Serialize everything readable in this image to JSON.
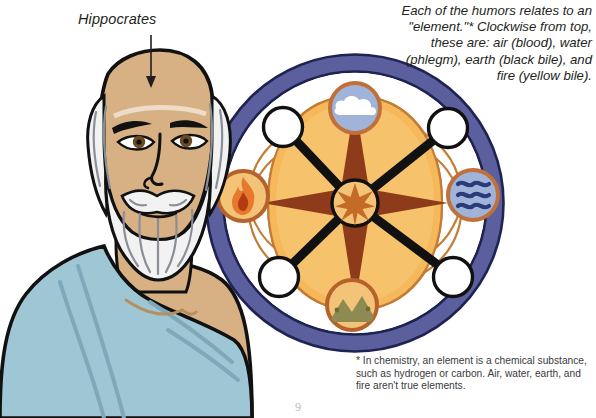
{
  "page": {
    "background_color": "#ffffff",
    "width": 596,
    "height": 418,
    "page_number": "9"
  },
  "annotations": {
    "figure_label": "Hippocrates",
    "caption": "Each of the humors relates to an \"element.\"* Clockwise from top, these are: air (blood), water (phlegm), earth (black bile), and fire (yellow bile).",
    "footnote": "* In chemistry, an element is a chemical substance, such as hydrogen or carbon. Air, water, earth, and fire aren't true elements."
  },
  "figure": {
    "name": "Hippocrates",
    "colors": {
      "skin": "#d7b183",
      "skin_shadow": "#c49a6c",
      "hair": "#f2f2f2",
      "hair_line": "#8a8f96",
      "robe": "#9ec6d4",
      "robe_shadow": "#7fa9ba",
      "outline": "#111111",
      "eye": "#6b4a22"
    }
  },
  "wheel": {
    "name": "humors-element-wheel",
    "center": {
      "x": 355,
      "y": 203
    },
    "outer_radius": 145,
    "colors": {
      "outer_ring": "#5b5f9e",
      "outer_ring_outline": "#1f2352",
      "inner_field": "#f5b95c",
      "inner_field_light": "#f8cd84",
      "star_dark": "#8e3b1c",
      "lens_white": "#ffffff",
      "lens_outline": "#c47b34",
      "node_white": "#ffffff",
      "node_outline": "#111111",
      "spoke": "#111111",
      "hub_fill": "#f3c377",
      "hub_star": "#c46b26"
    },
    "elements": [
      {
        "id": "air",
        "label": "air",
        "humor": "blood",
        "icon": "cloud-icon",
        "position": "top",
        "x": 355,
        "y": 108,
        "disc_fill": "#9fb4d8",
        "disc_ring": "#c0703a",
        "glyph_color": "#ffffff"
      },
      {
        "id": "water",
        "label": "water",
        "humor": "phlegm",
        "icon": "waves-icon",
        "position": "right",
        "x": 473,
        "y": 195,
        "disc_fill": "#9fb4d8",
        "disc_ring": "#c0703a",
        "glyph_color": "#2c3a7a"
      },
      {
        "id": "earth",
        "label": "earth",
        "humor": "black bile",
        "icon": "mountain-icon",
        "position": "bottom",
        "x": 352,
        "y": 305,
        "disc_fill": "#f3c377",
        "disc_ring": "#b5622c",
        "glyph_color": "#8d8a52"
      },
      {
        "id": "fire",
        "label": "fire",
        "humor": "yellow bile",
        "icon": "flame-icon",
        "position": "left",
        "x": 243,
        "y": 196,
        "disc_fill": "#f3c377",
        "disc_ring": "#b5622c",
        "glyph_color": "#d9602a"
      }
    ],
    "nodes": [
      {
        "id": "node-upper-left",
        "x": 283,
        "y": 127
      },
      {
        "id": "node-upper-right",
        "x": 448,
        "y": 128
      },
      {
        "id": "node-lower-right",
        "x": 453,
        "y": 277
      },
      {
        "id": "node-lower-left",
        "x": 279,
        "y": 277
      }
    ],
    "hub": {
      "x": 355,
      "y": 203,
      "radius": 22
    }
  },
  "arrow": {
    "name": "pointer-arrow",
    "from": {
      "x": 151,
      "y": 35
    },
    "to": {
      "x": 151,
      "y": 85
    },
    "color": "#231f20"
  }
}
